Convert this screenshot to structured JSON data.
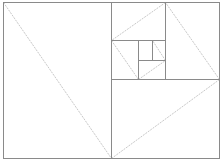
{
  "diagram": {
    "title": "",
    "background": "#ffffff",
    "frame_color": "#8a8a8a",
    "diagonal_color": "#c8c8c8",
    "outer_rect": {
      "x1": 3,
      "y1": 2,
      "x2": 219,
      "y2": 158
    },
    "divisions": [
      {
        "x1": 111,
        "y1": 2,
        "x2": 111,
        "y2": 158
      },
      {
        "x1": 111,
        "y1": 79,
        "x2": 219,
        "y2": 79
      },
      {
        "x1": 165,
        "y1": 2,
        "x2": 165,
        "y2": 79
      },
      {
        "x1": 111,
        "y1": 40,
        "x2": 165,
        "y2": 40
      },
      {
        "x1": 138,
        "y1": 40,
        "x2": 138,
        "y2": 79
      },
      {
        "x1": 138,
        "y1": 60,
        "x2": 165,
        "y2": 60
      },
      {
        "x1": 152,
        "y1": 40,
        "x2": 152,
        "y2": 60
      }
    ],
    "diagonals": [
      {
        "x1": 3,
        "y1": 2,
        "x2": 111,
        "y2": 158
      },
      {
        "x1": 111,
        "y1": 158,
        "x2": 219,
        "y2": 79
      },
      {
        "x1": 219,
        "y1": 79,
        "x2": 165,
        "y2": 2
      },
      {
        "x1": 165,
        "y1": 2,
        "x2": 111,
        "y2": 40
      },
      {
        "x1": 111,
        "y1": 40,
        "x2": 138,
        "y2": 79
      },
      {
        "x1": 138,
        "y1": 79,
        "x2": 165,
        "y2": 60
      },
      {
        "x1": 165,
        "y1": 60,
        "x2": 152,
        "y2": 40
      }
    ]
  }
}
